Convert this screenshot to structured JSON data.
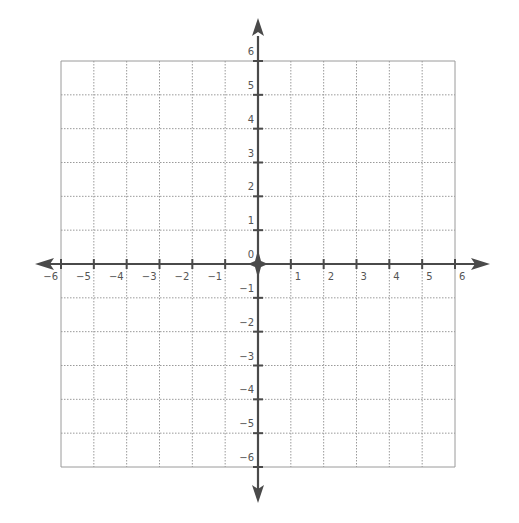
{
  "chart_data": {
    "type": "coordinate-plane",
    "title": "",
    "xlabel": "",
    "ylabel": "",
    "xlim": [
      -6,
      6
    ],
    "ylim": [
      -6,
      6
    ],
    "grid": true,
    "grid_step": 1,
    "x_tick_labels": [
      "-6",
      "-5",
      "-4",
      "-3",
      "-2",
      "-1",
      "1",
      "2",
      "3",
      "4",
      "5",
      "6"
    ],
    "y_tick_labels": [
      "6",
      "5",
      "4",
      "3",
      "2",
      "1",
      "0",
      "-1",
      "-2",
      "-3",
      "-4",
      "-5",
      "-6"
    ],
    "axes_arrows": true,
    "origin_marker": "four-point star"
  },
  "colors": {
    "axis": "#4a4a4a",
    "grid": "#9a9a9a",
    "label": "#555555",
    "background": "#ffffff"
  },
  "x_labels": [
    {
      "text": "−6",
      "value": -6
    },
    {
      "text": "−5",
      "value": -5
    },
    {
      "text": "−4",
      "value": -4
    },
    {
      "text": "−3",
      "value": -3
    },
    {
      "text": "−2",
      "value": -2
    },
    {
      "text": "−1",
      "value": -1
    },
    {
      "text": "1",
      "value": 1
    },
    {
      "text": "2",
      "value": 2
    },
    {
      "text": "3",
      "value": 3
    },
    {
      "text": "4",
      "value": 4
    },
    {
      "text": "5",
      "value": 5
    },
    {
      "text": "6",
      "value": 6
    }
  ],
  "y_labels": [
    {
      "text": "6",
      "value": 6
    },
    {
      "text": "5",
      "value": 5
    },
    {
      "text": "4",
      "value": 4
    },
    {
      "text": "3",
      "value": 3
    },
    {
      "text": "2",
      "value": 2
    },
    {
      "text": "1",
      "value": 1
    },
    {
      "text": "0",
      "value": 0
    },
    {
      "text": "−1",
      "value": -1
    },
    {
      "text": "−2",
      "value": -2
    },
    {
      "text": "−3",
      "value": -3
    },
    {
      "text": "−4",
      "value": -4
    },
    {
      "text": "−5",
      "value": -5
    },
    {
      "text": "−6",
      "value": -6
    }
  ]
}
